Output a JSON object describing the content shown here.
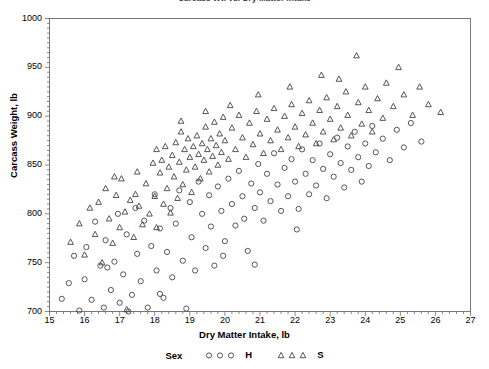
{
  "chart_title": "Carcass Wt. vs. Dry Matter Intake",
  "axis": {
    "x_label": "Dry Matter Intake, lb",
    "y_label": "Carcass Weight, lb",
    "x_ticks": [
      "15",
      "16",
      "17",
      "18",
      "19",
      "20",
      "21",
      "22",
      "23",
      "24",
      "25",
      "26",
      "27"
    ],
    "y_ticks": [
      "1000",
      "950",
      "900",
      "850",
      "800",
      "750",
      "700"
    ]
  },
  "legend": {
    "title": "Sex",
    "entries": [
      {
        "label": "H",
        "marker": "circle-marker",
        "color": "#444444"
      },
      {
        "label": "S",
        "marker": "triangle-marker",
        "color": "#444444"
      }
    ]
  },
  "chart_data": {
    "type": "scatter",
    "title": "Carcass Wt. vs. Dry Matter Intake",
    "xlabel": "Dry Matter Intake, lb",
    "ylabel": "Carcass Weight, lb",
    "xlim": [
      15,
      27
    ],
    "ylim": [
      700,
      1000
    ],
    "xticks": [
      15,
      16,
      17,
      18,
      19,
      20,
      21,
      22,
      23,
      24,
      25,
      26,
      27
    ],
    "yticks": [
      700,
      750,
      800,
      850,
      900,
      950,
      1000
    ],
    "grid": false,
    "legend_position": "below-axis",
    "legend_title": "Sex",
    "series": [
      {
        "name": "H",
        "marker": "circle",
        "color": "#444444",
        "points": [
          [
            15.35,
            713
          ],
          [
            15.55,
            729
          ],
          [
            15.7,
            757
          ],
          [
            15.85,
            701
          ],
          [
            16.0,
            733
          ],
          [
            16.05,
            766
          ],
          [
            16.2,
            712
          ],
          [
            16.3,
            792
          ],
          [
            16.45,
            747
          ],
          [
            16.55,
            704
          ],
          [
            16.6,
            773
          ],
          [
            16.75,
            722
          ],
          [
            16.85,
            751
          ],
          [
            16.95,
            800
          ],
          [
            17.0,
            709
          ],
          [
            17.1,
            738
          ],
          [
            17.2,
            779
          ],
          [
            17.35,
            717
          ],
          [
            17.45,
            806
          ],
          [
            17.5,
            759
          ],
          [
            17.6,
            731
          ],
          [
            17.7,
            793
          ],
          [
            17.8,
            704
          ],
          [
            17.9,
            767
          ],
          [
            18.0,
            820
          ],
          [
            18.05,
            742
          ],
          [
            18.15,
            785
          ],
          [
            18.25,
            714
          ],
          [
            18.35,
            761
          ],
          [
            18.45,
            806
          ],
          [
            18.5,
            735
          ],
          [
            18.6,
            790
          ],
          [
            18.7,
            824
          ],
          [
            18.8,
            752
          ],
          [
            18.9,
            703
          ],
          [
            19.0,
            812
          ],
          [
            19.05,
            776
          ],
          [
            19.15,
            742
          ],
          [
            19.25,
            833
          ],
          [
            19.35,
            800
          ],
          [
            19.45,
            765
          ],
          [
            19.55,
            819
          ],
          [
            19.6,
            787
          ],
          [
            19.7,
            747
          ],
          [
            19.8,
            828
          ],
          [
            19.9,
            803
          ],
          [
            20.0,
            772
          ],
          [
            20.1,
            836
          ],
          [
            20.2,
            810
          ],
          [
            20.3,
            788
          ],
          [
            20.4,
            844
          ],
          [
            20.5,
            818
          ],
          [
            20.55,
            795
          ],
          [
            20.65,
            762
          ],
          [
            20.75,
            831
          ],
          [
            20.85,
            806
          ],
          [
            20.95,
            851
          ],
          [
            21.0,
            822
          ],
          [
            21.1,
            793
          ],
          [
            21.2,
            841
          ],
          [
            21.3,
            813
          ],
          [
            21.4,
            862
          ],
          [
            21.5,
            830
          ],
          [
            21.6,
            803
          ],
          [
            21.7,
            847
          ],
          [
            21.8,
            818
          ],
          [
            21.9,
            856
          ],
          [
            22.0,
            833
          ],
          [
            22.1,
            805
          ],
          [
            22.2,
            866
          ],
          [
            22.3,
            841
          ],
          [
            22.4,
            820
          ],
          [
            22.5,
            855
          ],
          [
            22.6,
            829
          ],
          [
            22.7,
            872
          ],
          [
            22.8,
            846
          ],
          [
            22.9,
            816
          ],
          [
            23.0,
            861
          ],
          [
            23.1,
            838
          ],
          [
            23.2,
            878
          ],
          [
            23.3,
            852
          ],
          [
            23.4,
            827
          ],
          [
            23.5,
            869
          ],
          [
            23.6,
            845
          ],
          [
            23.7,
            884
          ],
          [
            23.8,
            858
          ],
          [
            23.9,
            833
          ],
          [
            24.0,
            872
          ],
          [
            24.1,
            849
          ],
          [
            24.2,
            890
          ],
          [
            24.3,
            863
          ],
          [
            24.5,
            877
          ],
          [
            24.7,
            855
          ],
          [
            24.9,
            886
          ],
          [
            25.1,
            868
          ],
          [
            25.3,
            893
          ],
          [
            25.6,
            874
          ],
          [
            20.85,
            748
          ],
          [
            22.05,
            784
          ],
          [
            19.95,
            757
          ],
          [
            18.15,
            718
          ],
          [
            17.25,
            700
          ],
          [
            16.65,
            745
          ]
        ]
      },
      {
        "name": "S",
        "marker": "triangle",
        "color": "#444444",
        "points": [
          [
            15.6,
            771
          ],
          [
            15.85,
            790
          ],
          [
            16.0,
            758
          ],
          [
            16.15,
            806
          ],
          [
            16.3,
            779
          ],
          [
            16.4,
            812
          ],
          [
            16.5,
            750
          ],
          [
            16.6,
            826
          ],
          [
            16.7,
            795
          ],
          [
            16.8,
            770
          ],
          [
            16.9,
            819
          ],
          [
            17.0,
            786
          ],
          [
            17.05,
            836
          ],
          [
            17.15,
            802
          ],
          [
            17.2,
            702
          ],
          [
            17.3,
            814
          ],
          [
            17.4,
            776
          ],
          [
            17.5,
            843
          ],
          [
            17.55,
            808
          ],
          [
            17.65,
            789
          ],
          [
            17.75,
            831
          ],
          [
            17.85,
            800
          ],
          [
            17.95,
            852
          ],
          [
            18.0,
            818
          ],
          [
            18.05,
            786
          ],
          [
            18.15,
            842
          ],
          [
            18.2,
            855
          ],
          [
            18.25,
            810
          ],
          [
            18.3,
            869
          ],
          [
            18.35,
            826
          ],
          [
            18.4,
            848
          ],
          [
            18.45,
            801
          ],
          [
            18.5,
            860
          ],
          [
            18.55,
            838
          ],
          [
            18.6,
            873
          ],
          [
            18.65,
            816
          ],
          [
            18.7,
            853
          ],
          [
            18.75,
            884
          ],
          [
            18.8,
            830
          ],
          [
            18.85,
            866
          ],
          [
            18.9,
            845
          ],
          [
            18.95,
            877
          ],
          [
            19.0,
            858
          ],
          [
            19.05,
            822
          ],
          [
            19.1,
            869
          ],
          [
            19.15,
            848
          ],
          [
            19.2,
            880
          ],
          [
            19.25,
            861
          ],
          [
            19.3,
            836
          ],
          [
            19.35,
            872
          ],
          [
            19.4,
            855
          ],
          [
            19.45,
            889
          ],
          [
            19.5,
            866
          ],
          [
            19.55,
            843
          ],
          [
            19.6,
            877
          ],
          [
            19.65,
            859
          ],
          [
            19.7,
            894
          ],
          [
            19.75,
            870
          ],
          [
            19.8,
            850
          ],
          [
            19.85,
            882
          ],
          [
            19.9,
            863
          ],
          [
            19.95,
            899
          ],
          [
            20.0,
            875
          ],
          [
            20.1,
            856
          ],
          [
            20.2,
            888
          ],
          [
            20.3,
            866
          ],
          [
            20.4,
            901
          ],
          [
            20.5,
            878
          ],
          [
            20.6,
            858
          ],
          [
            20.7,
            893
          ],
          [
            20.8,
            871
          ],
          [
            20.9,
            905
          ],
          [
            21.0,
            882
          ],
          [
            21.1,
            862
          ],
          [
            21.2,
            897
          ],
          [
            21.3,
            875
          ],
          [
            21.4,
            908
          ],
          [
            21.5,
            886
          ],
          [
            21.6,
            866
          ],
          [
            21.7,
            900
          ],
          [
            21.8,
            878
          ],
          [
            21.9,
            912
          ],
          [
            22.0,
            889
          ],
          [
            22.1,
            869
          ],
          [
            22.2,
            903
          ],
          [
            22.3,
            881
          ],
          [
            22.4,
            916
          ],
          [
            22.5,
            893
          ],
          [
            22.6,
            872
          ],
          [
            22.7,
            906
          ],
          [
            22.8,
            884
          ],
          [
            22.9,
            919
          ],
          [
            23.0,
            897
          ],
          [
            23.1,
            876
          ],
          [
            23.2,
            910
          ],
          [
            23.3,
            888
          ],
          [
            23.45,
            925
          ],
          [
            23.5,
            901
          ],
          [
            23.6,
            880
          ],
          [
            23.75,
            962
          ],
          [
            23.8,
            914
          ],
          [
            23.9,
            892
          ],
          [
            24.0,
            930
          ],
          [
            24.1,
            906
          ],
          [
            24.2,
            884
          ],
          [
            24.35,
            918
          ],
          [
            24.5,
            898
          ],
          [
            24.6,
            934
          ],
          [
            24.8,
            910
          ],
          [
            24.95,
            950
          ],
          [
            25.1,
            922
          ],
          [
            25.35,
            901
          ],
          [
            25.55,
            930
          ],
          [
            25.8,
            912
          ],
          [
            26.15,
            904
          ],
          [
            23.25,
            938
          ],
          [
            22.75,
            942
          ],
          [
            21.85,
            930
          ],
          [
            20.95,
            922
          ],
          [
            20.15,
            911
          ],
          [
            19.45,
            905
          ],
          [
            18.75,
            895
          ],
          [
            18.05,
            866
          ],
          [
            17.45,
            820
          ],
          [
            16.85,
            838
          ]
        ]
      }
    ]
  }
}
